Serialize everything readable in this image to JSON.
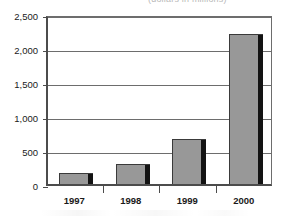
{
  "title": {
    "visible_fragment": "(dollars in millions)",
    "clipped": "true"
  },
  "chart_data": {
    "type": "bar",
    "title": "(dollars in millions)",
    "xlabel": "",
    "ylabel": "",
    "categories": [
      "1997",
      "1998",
      "1999",
      "2000"
    ],
    "values": [
      160,
      290,
      655,
      2205
    ],
    "series": [
      {
        "name": "Annual total",
        "values": [
          160,
          290,
          655,
          2205
        ]
      }
    ],
    "ylim": [
      0,
      2500
    ],
    "ytick_values": [
      0,
      500,
      1000,
      1500,
      2000,
      2500
    ],
    "ytick_labels": [
      "0",
      "500",
      "1,000",
      "1,500",
      "2,000",
      "2,500"
    ],
    "grid": "horizontal",
    "legend": "none",
    "bar_fill_color": "#989898",
    "bar_shadow_color": "#131313",
    "axis_color": "#4c4c4c",
    "grid_color": "#6d6d6d",
    "background_color": "#ffffff"
  },
  "axis": {
    "y_ticks": [
      {
        "label": "2,500",
        "value": 2500
      },
      {
        "label": "2,000",
        "value": 2000
      },
      {
        "label": "1,500",
        "value": 1500
      },
      {
        "label": "1,000",
        "value": 1000
      },
      {
        "label": "500",
        "value": 500
      },
      {
        "label": "0",
        "value": 0
      }
    ],
    "x_ticks": [
      {
        "label": "1997"
      },
      {
        "label": "1998"
      },
      {
        "label": "1999"
      },
      {
        "label": "2000"
      }
    ]
  }
}
